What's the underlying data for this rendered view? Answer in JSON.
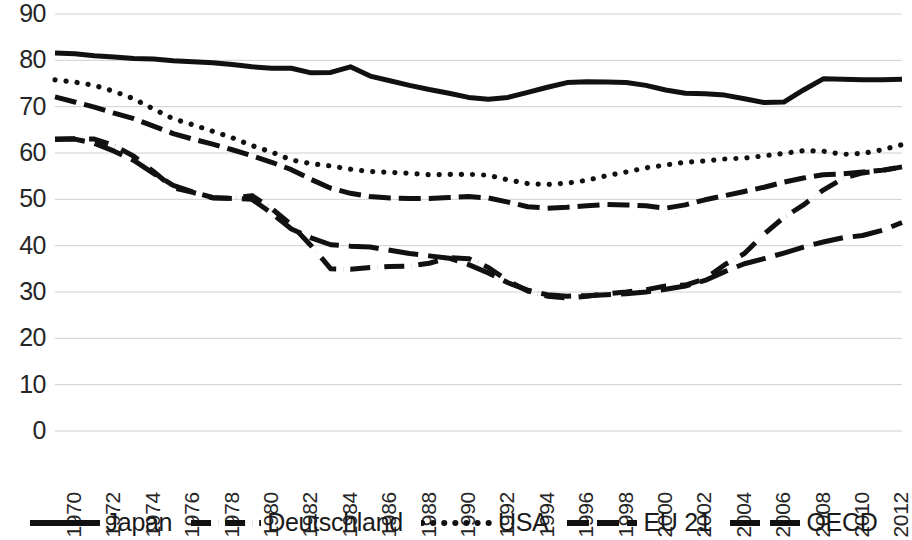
{
  "chart_data": {
    "type": "line",
    "title": "",
    "xlabel": "",
    "ylabel": "",
    "ylim": [
      0,
      90
    ],
    "xlim": [
      1970,
      2013
    ],
    "grid": true,
    "legend_position": "bottom",
    "y_ticks": [
      90,
      80,
      70,
      60,
      50,
      40,
      30,
      20,
      10,
      0
    ],
    "x_ticks": [
      1970,
      1972,
      1974,
      1976,
      1978,
      1980,
      1982,
      1984,
      1986,
      1988,
      1990,
      1992,
      1994,
      1996,
      1998,
      2000,
      2002,
      2004,
      2006,
      2008,
      2010,
      2012
    ],
    "x": [
      1970,
      1971,
      1972,
      1973,
      1974,
      1975,
      1976,
      1977,
      1978,
      1979,
      1980,
      1981,
      1982,
      1983,
      1984,
      1985,
      1986,
      1987,
      1988,
      1989,
      1990,
      1991,
      1992,
      1993,
      1994,
      1995,
      1996,
      1997,
      1998,
      1999,
      2000,
      2001,
      2002,
      2003,
      2004,
      2005,
      2006,
      2007,
      2008,
      2009,
      2010,
      2011,
      2012,
      2013
    ],
    "series": [
      {
        "name": "Japan",
        "style": "solid",
        "color": "#111111",
        "values": [
          81.6,
          81.4,
          81.0,
          80.7,
          80.4,
          80.3,
          79.9,
          79.7,
          79.5,
          79.1,
          78.6,
          78.3,
          78.3,
          77.3,
          77.4,
          78.6,
          76.6,
          75.6,
          74.6,
          73.7,
          72.9,
          72.0,
          71.6,
          72.0,
          73.1,
          74.2,
          75.2,
          75.4,
          75.3,
          75.2,
          74.6,
          73.6,
          72.9,
          72.8,
          72.5,
          71.7,
          70.9,
          71.0,
          73.6,
          76.0,
          75.9,
          75.8,
          75.8,
          75.9
        ]
      },
      {
        "name": "Deutschland",
        "style": "dashdot",
        "color": "#111111",
        "values": [
          63.0,
          63.1,
          63.0,
          61.6,
          59.3,
          56.0,
          52.5,
          51.5,
          50.3,
          50.2,
          50.8,
          48.0,
          44.5,
          40.0,
          35.0,
          34.9,
          35.3,
          35.5,
          35.6,
          36.2,
          37.4,
          37.2,
          35.3,
          32.4,
          30.2,
          29.1,
          28.7,
          29.1,
          29.6,
          30.0,
          30.5,
          31.3,
          31.5,
          32.8,
          35.9,
          38.3,
          42.5,
          46.1,
          48.8,
          52.0,
          54.5,
          55.7,
          56.2,
          57.0
        ]
      },
      {
        "name": "USA",
        "style": "dotted",
        "color": "#111111",
        "values": [
          75.8,
          75.3,
          74.6,
          73.3,
          71.7,
          69.5,
          67.4,
          66.1,
          64.7,
          63.3,
          61.6,
          60.2,
          58.5,
          57.7,
          57.2,
          56.5,
          56.0,
          55.8,
          55.6,
          55.3,
          55.4,
          55.4,
          55.2,
          54.2,
          53.4,
          53.2,
          53.5,
          54.1,
          55.1,
          55.9,
          56.8,
          57.4,
          58.0,
          58.3,
          58.7,
          58.9,
          59.4,
          59.9,
          60.5,
          60.4,
          59.7,
          59.9,
          60.7,
          61.8
        ]
      },
      {
        "name": "EU 21",
        "style": "dash-medium",
        "color": "#111111",
        "values": [
          72.1,
          71.0,
          69.9,
          68.6,
          67.4,
          65.8,
          64.2,
          63.0,
          61.9,
          60.7,
          59.4,
          58.0,
          56.4,
          54.3,
          52.4,
          51.3,
          50.6,
          50.3,
          50.2,
          50.2,
          50.4,
          50.6,
          50.3,
          49.4,
          48.4,
          48.1,
          48.3,
          48.6,
          48.9,
          48.8,
          48.6,
          48.1,
          48.8,
          49.9,
          50.8,
          51.7,
          52.6,
          53.7,
          54.6,
          55.3,
          55.5,
          55.9,
          56.3,
          57.0
        ]
      },
      {
        "name": "OECD",
        "style": "dash-long",
        "color": "#111111",
        "values": [
          62.9,
          63.0,
          62.1,
          60.4,
          58.4,
          55.6,
          53.0,
          51.6,
          50.4,
          50.2,
          50.0,
          47.0,
          43.6,
          41.7,
          40.2,
          39.9,
          39.7,
          39.0,
          38.3,
          37.8,
          37.3,
          35.9,
          34.1,
          32.0,
          30.4,
          29.4,
          29.1,
          29.2,
          29.4,
          29.6,
          30.0,
          30.6,
          31.3,
          32.5,
          34.4,
          36.1,
          37.2,
          38.4,
          39.7,
          40.8,
          41.7,
          42.2,
          43.3,
          45.0
        ]
      }
    ]
  },
  "legend": {
    "items": [
      {
        "label": "Japan",
        "style": "solid"
      },
      {
        "label": "Deutschland",
        "style": "dashdot"
      },
      {
        "label": "USA",
        "style": "dotted"
      },
      {
        "label": "EU 21",
        "style": "dash-medium"
      },
      {
        "label": "OECD",
        "style": "dash-long"
      }
    ]
  }
}
